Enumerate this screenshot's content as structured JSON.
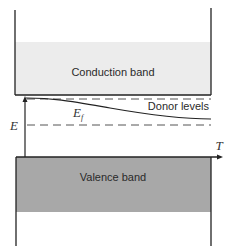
{
  "diagram": {
    "type": "energy-band-diagram",
    "colors": {
      "background": "#ffffff",
      "conduction_band_fill": "#ececec",
      "valence_band_fill": "#a8a8a8",
      "line": "#222222",
      "dashed_line": "#555555"
    },
    "conduction_band": {
      "label": "Conduction band"
    },
    "valence_band": {
      "label": "Valence band"
    },
    "donor_levels": {
      "label": "Donor levels"
    },
    "fermi_level": {
      "label": "E",
      "subscript": "f"
    },
    "axes": {
      "y_label": "E",
      "x_label": "T"
    }
  }
}
